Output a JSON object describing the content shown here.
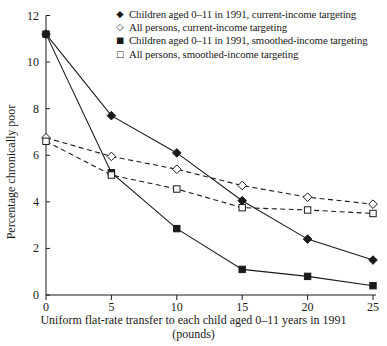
{
  "figure": {
    "x_axis_label_line1": "Uniform flat-rate transfer to each child aged 0–11 years in 1991",
    "x_axis_label_line2": "(pounds)"
  },
  "chart_data": {
    "type": "line",
    "title": "",
    "xlabel": "Uniform flat-rate transfer to each child aged 0–11 years in 1991 (pounds)",
    "ylabel": "Percentage chronically poor",
    "x": [
      0,
      5,
      10,
      15,
      20,
      25
    ],
    "x_ticks": [
      0,
      5,
      10,
      15,
      20,
      25
    ],
    "y_ticks": [
      0,
      2,
      4,
      6,
      8,
      10,
      12
    ],
    "xlim": [
      0,
      25
    ],
    "ylim": [
      0,
      12
    ],
    "grid": false,
    "legend_position": "top-right-inside",
    "line_color": "#1a1a1a",
    "background": "#ffffff",
    "series": [
      {
        "name": "Children aged 0–11 in 1991, current-income targeting",
        "glyph": "◆",
        "marker": "filled-diamond",
        "line": "solid",
        "values": [
          11.2,
          7.7,
          6.1,
          4.05,
          2.4,
          1.5
        ]
      },
      {
        "name": "All persons, current-income targeting",
        "glyph": "◇",
        "marker": "open-diamond",
        "line": "dashed",
        "values": [
          6.75,
          5.95,
          5.4,
          4.7,
          4.2,
          3.9
        ]
      },
      {
        "name": "Children aged 0–11 in 1991, smoothed-income targeting",
        "glyph": "■",
        "marker": "filled-square",
        "line": "solid",
        "values": [
          11.2,
          5.25,
          2.85,
          1.1,
          0.8,
          0.4
        ]
      },
      {
        "name": "All persons, smoothed-income targeting",
        "glyph": "□",
        "marker": "open-square",
        "line": "dashed",
        "values": [
          6.6,
          5.15,
          4.55,
          3.75,
          3.65,
          3.5
        ]
      }
    ]
  }
}
